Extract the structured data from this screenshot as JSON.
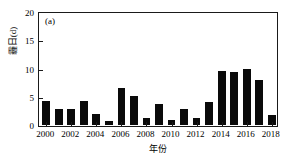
{
  "chart_data": {
    "type": "bar",
    "title": "",
    "panel_label": "(a)",
    "xlabel": "年份",
    "ylabel": "霾日(d)",
    "categories": [
      "2000",
      "2001",
      "2002",
      "2003",
      "2004",
      "2005",
      "2006",
      "2007",
      "2008",
      "2009",
      "2010",
      "2011",
      "2012",
      "2013",
      "2014",
      "2015",
      "2016",
      "2017",
      "2018"
    ],
    "values": [
      4.2,
      2.9,
      2.9,
      4.3,
      1.9,
      0.7,
      6.5,
      5.2,
      1.3,
      3.7,
      0.8,
      2.9,
      1.3,
      4.1,
      9.6,
      9.3,
      9.9,
      8.0,
      1.7
    ],
    "ylim": [
      0,
      20
    ],
    "yticks": [
      "0",
      "5",
      "10",
      "15",
      "20"
    ],
    "ytick_values": [
      0,
      5,
      10,
      15,
      20
    ],
    "xtick_labels": [
      "2000",
      "2002",
      "2004",
      "2006",
      "2008",
      "2010",
      "2012",
      "2014",
      "2016",
      "2018"
    ],
    "xtick_values": [
      2000,
      2002,
      2004,
      2006,
      2008,
      2010,
      2012,
      2014,
      2016,
      2018
    ],
    "xlim": [
      1999.5,
      2018.5
    ],
    "grid": false,
    "legend": null,
    "bar_color": "#0a0a0a",
    "axis_color": "#1a1a1a",
    "background_color": "#ffffff"
  }
}
